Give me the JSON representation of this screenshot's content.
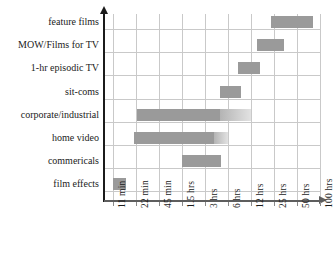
{
  "chart_data": {
    "type": "bar",
    "title": "",
    "subtitle": "",
    "xlabel": "",
    "ylabel": "",
    "orientation": "horizontal",
    "bar_style": "range",
    "axis_scale": "log-like categorical",
    "grid": true,
    "legend_position": "none",
    "colors": {
      "bar_solid": "#9a9a9a",
      "bar_fade_start": "#b4b4b4",
      "bar_fade_end": "#e2e2e2",
      "gridline": "#c9c9c9",
      "axis": "#1b1b1b",
      "x_axis": "#5e5e5e",
      "text": "#1b1b1b",
      "background": "#ffffff"
    },
    "x_tick_labels": [
      "11 min",
      "22 min",
      "45 min",
      "1.5 hrs",
      "3 hrs",
      "6 hrs",
      "12 hrs",
      "25 hrs",
      "50 hrs",
      "100 hrs"
    ],
    "categories": [
      "feature films",
      "MOW/Films for TV",
      "1-hr episodic TV",
      "sit-coms",
      "corporate/industrial",
      "home video",
      "commericals",
      "film effects"
    ],
    "bars": [
      {
        "category": "feature films",
        "start_label": "25 hrs",
        "end_label": "50 hrs",
        "start_index": 6.85,
        "end_index": 8.7,
        "fade_end_index": null
      },
      {
        "category": "MOW/Films for TV",
        "start_label": "12 hrs",
        "end_label": "25 hrs",
        "start_index": 6.25,
        "end_index": 7.45,
        "fade_end_index": null
      },
      {
        "category": "1-hr episodic TV",
        "start_label": "6 hrs",
        "end_label": "12 hrs",
        "start_index": 5.45,
        "end_index": 6.4,
        "fade_end_index": null
      },
      {
        "category": "sit-coms",
        "start_label": "3 hrs",
        "end_label": "6 hrs",
        "start_index": 4.65,
        "end_index": 5.55,
        "fade_end_index": null
      },
      {
        "category": "corporate/industrial",
        "start_label": "22 min",
        "end_label": "6 hrs",
        "start_index": 1.05,
        "end_index": 4.65,
        "fade_end_index": 6.0
      },
      {
        "category": "home video",
        "start_label": "22 min",
        "end_label": "3 hrs",
        "start_index": 0.92,
        "end_index": 4.4,
        "fade_end_index": 5.0
      },
      {
        "category": "commericals",
        "start_label": "1.5 hrs",
        "end_label": "3 hrs",
        "start_index": 3.0,
        "end_index": 4.7,
        "fade_end_index": null
      },
      {
        "category": "film effects",
        "start_label": "11 min",
        "end_label": "11 min",
        "start_index": 0.0,
        "end_index": 0.55,
        "fade_end_index": null
      }
    ]
  }
}
